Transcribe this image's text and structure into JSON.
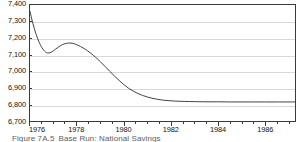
{
  "figure": {
    "caption_number": "Figure 7A.5",
    "caption_text": "Base Run: National Savings"
  },
  "chart_data": {
    "type": "line",
    "title": "Base Run: National Savings",
    "xlabel": "",
    "ylabel": "",
    "xlim": [
      1976,
      1987.3
    ],
    "ylim": [
      6700,
      7400
    ],
    "grid": true,
    "legend": "none",
    "y_ticks": [
      7400,
      7300,
      7200,
      7100,
      7000,
      6900,
      6800,
      6700
    ],
    "y_tick_labels": [
      "7,400",
      "7,300",
      "7,200",
      "7,100",
      "7,000",
      "6,900",
      "6,800",
      "6,700"
    ],
    "x_ticks": [
      1976,
      1978,
      1980,
      1982,
      1984,
      1986
    ],
    "x_tick_labels": [
      "1976",
      "1978",
      "1980",
      "1982",
      "1984",
      "1986"
    ],
    "x_minor_tick_interval": 0.5,
    "series": [
      {
        "name": "National Savings",
        "color": "#2f2f2f",
        "x": [
          1976.0,
          1976.12,
          1976.25,
          1976.4,
          1976.55,
          1976.7,
          1976.85,
          1977.0,
          1977.2,
          1977.4,
          1977.6,
          1977.8,
          1978.0,
          1978.3,
          1978.6,
          1979.0,
          1979.4,
          1979.8,
          1980.2,
          1980.6,
          1981.0,
          1981.4,
          1981.8,
          1982.2,
          1982.6,
          1983.0,
          1983.5,
          1984.0,
          1984.5,
          1985.0,
          1985.5,
          1986.0,
          1986.5,
          1987.0,
          1987.3
        ],
        "y": [
          7362,
          7290,
          7228,
          7172,
          7134,
          7113,
          7112,
          7124,
          7145,
          7162,
          7170,
          7169,
          7160,
          7138,
          7108,
          7058,
          7000,
          6945,
          6898,
          6866,
          6845,
          6832,
          6824,
          6820,
          6818,
          6817,
          6816,
          6816,
          6815,
          6815,
          6815,
          6815,
          6815,
          6815,
          6815
        ]
      }
    ]
  }
}
